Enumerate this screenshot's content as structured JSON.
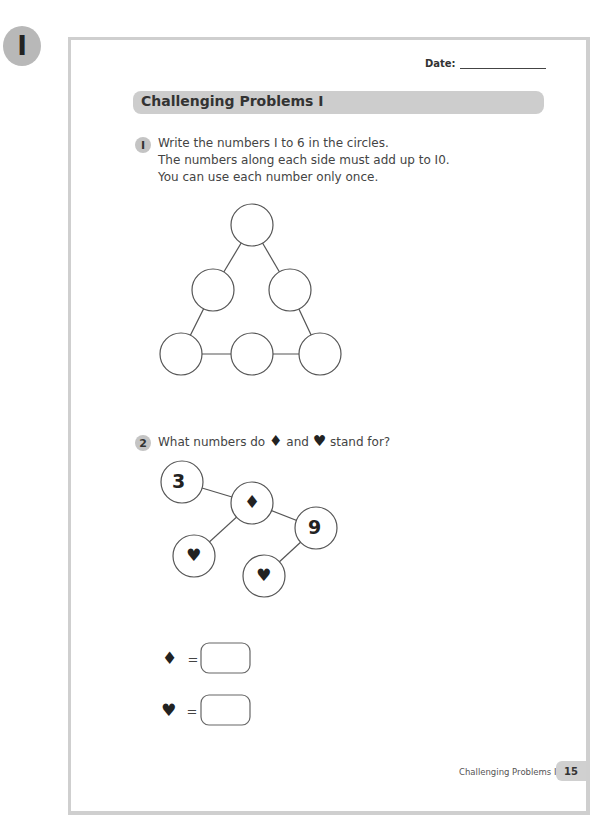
{
  "chapter_badge": "I",
  "header": {
    "date_label": "Date:"
  },
  "title": "Challenging Problems I",
  "question1": {
    "number": "I",
    "lines": [
      "Write the numbers I to 6 in the circles.",
      "The numbers along each side must add up to I0.",
      "You can use each number only once."
    ]
  },
  "question2": {
    "number": "2",
    "text_before": "What numbers do",
    "text_and": "and",
    "text_after": "stand for?",
    "diamond_symbol": "♦",
    "heart_symbol": "♥",
    "given_values": {
      "a": "3",
      "b": "9"
    },
    "equals": "="
  },
  "footer": {
    "label": "Challenging Problems I",
    "page_number": "15"
  }
}
